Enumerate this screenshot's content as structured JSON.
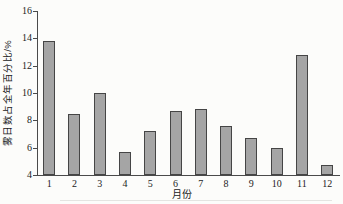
{
  "chart_data": {
    "type": "bar",
    "title": "",
    "xlabel": "月份",
    "ylabel": "雾日数占全年百分比/%",
    "categories": [
      "1",
      "2",
      "3",
      "4",
      "5",
      "6",
      "7",
      "8",
      "9",
      "10",
      "11",
      "12"
    ],
    "values": [
      13.8,
      8.5,
      10.0,
      5.7,
      7.2,
      8.7,
      8.8,
      7.6,
      6.7,
      6.0,
      12.8,
      4.7
    ],
    "ylim": [
      4,
      16
    ],
    "yticks": [
      4,
      6,
      8,
      10,
      12,
      14,
      16
    ],
    "grid": false,
    "legend": null,
    "bar_fill_color": "#a5a5a5",
    "bar_border_color": "#454545",
    "axis_color": "#4a4a4a",
    "background_color": "#fcfcfa"
  }
}
